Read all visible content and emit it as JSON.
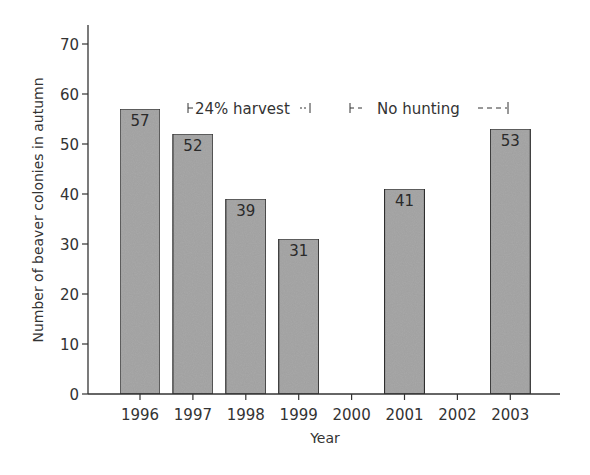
{
  "chart_data": {
    "type": "bar",
    "title": "",
    "xlabel": "Year",
    "ylabel": "Number of beaver colonies in autumn",
    "ylim": [
      0,
      70
    ],
    "yticks": [
      0,
      10,
      20,
      30,
      40,
      50,
      60,
      70
    ],
    "categories": [
      "1996",
      "1997",
      "1998",
      "1999",
      "2000",
      "2001",
      "2002",
      "2003"
    ],
    "values": [
      57,
      52,
      39,
      31,
      null,
      41,
      null,
      53
    ],
    "data_labels": [
      "57",
      "52",
      "39",
      "31",
      "",
      "41",
      "",
      "53"
    ],
    "grid": false,
    "legend": null,
    "bar_color": "#a9a9a9",
    "bar_edge_color": "#333333",
    "annotations": [
      {
        "text": "24% harvest",
        "span": [
          "1997",
          "1999"
        ],
        "style": "solid-bracket",
        "y": 57
      },
      {
        "text": "No hunting",
        "span": [
          "2000",
          "2003"
        ],
        "style": "dashed-bracket",
        "y": 57
      }
    ]
  },
  "annotations": {
    "harvest": "24% harvest",
    "no_hunting": "No hunting"
  },
  "axes": {
    "xlabel": "Year",
    "ylabel": "Number of beaver colonies in autumn"
  }
}
